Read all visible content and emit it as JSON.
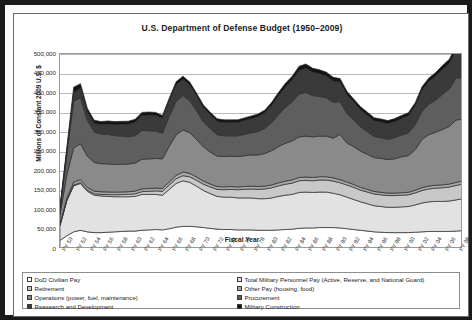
{
  "chart_data": {
    "type": "area",
    "title": "U.S. Department of Defense Budget (1950–2009)",
    "xlabel": "Fiscal Year",
    "ylabel": "Millions of Constant 2009 U.S. $",
    "ylim": [
      0,
      500000
    ],
    "ytick_step": 50000,
    "ytick_labels": [
      "500,000",
      "450,000",
      "400,000",
      "350,000",
      "300,000",
      "250,000",
      "200,000",
      "150,000",
      "100,000",
      "50,000",
      "0"
    ],
    "grid": true,
    "legend_position": "bottom",
    "stacked": true,
    "x": [
      1950,
      1951,
      1952,
      1953,
      1954,
      1955,
      1956,
      1957,
      1958,
      1959,
      1960,
      1961,
      1962,
      1963,
      1964,
      1965,
      1966,
      1967,
      1968,
      1969,
      1970,
      1971,
      1972,
      1973,
      1974,
      1975,
      1976,
      1977,
      1978,
      1979,
      1980,
      1981,
      1982,
      1983,
      1984,
      1985,
      1986,
      1987,
      1988,
      1989,
      1990,
      1991,
      1992,
      1993,
      1994,
      1995,
      1996,
      1997,
      1998,
      1999,
      2000,
      2001,
      2002,
      2003,
      2004,
      2005,
      2006,
      2007,
      2008,
      2009
    ],
    "xtick_labels": [
      "FY 50",
      "FY 52",
      "FY 54",
      "FY 56",
      "FY 58",
      "FY 60",
      "FY 62",
      "FY 64",
      "FY 66",
      "FY 68",
      "FY 70",
      "FY 72",
      "FY 74",
      "FY 76",
      "FY 78",
      "FY 80",
      "FY 82",
      "FY 84",
      "FY 86",
      "FY 88",
      "FY 90",
      "FY 92",
      "FY 94",
      "FY 96",
      "FY 98",
      "FY 00",
      "FY 02",
      "FY 04",
      "FY 06",
      "FY 08"
    ],
    "series": [
      {
        "name": "DoD Civilian Pay",
        "color": "#ffffff",
        "values": [
          22000,
          34000,
          44000,
          48000,
          44000,
          42000,
          42000,
          43000,
          44000,
          45000,
          46000,
          46000,
          48000,
          49000,
          50000,
          49000,
          52000,
          56000,
          58000,
          58000,
          57000,
          55000,
          53000,
          51000,
          50000,
          50000,
          49000,
          49000,
          49000,
          48000,
          48000,
          48000,
          49000,
          50000,
          51000,
          53000,
          54000,
          54000,
          55000,
          55000,
          55000,
          54000,
          52000,
          50000,
          48000,
          46000,
          44000,
          43000,
          42000,
          42000,
          42000,
          42000,
          43000,
          44000,
          45000,
          45000,
          45000,
          45000,
          46000,
          47000
        ]
      },
      {
        "name": "Total Military Personnel Pay (Active, Reserve, and National Guard)",
        "color": "#e2e2e2",
        "values": [
          38000,
          90000,
          118000,
          120000,
          104000,
          96000,
          94000,
          92000,
          90000,
          89000,
          88000,
          89000,
          92000,
          91000,
          90000,
          89000,
          101000,
          112000,
          117000,
          113000,
          104000,
          95000,
          89000,
          84000,
          83000,
          83000,
          82000,
          82000,
          82000,
          81000,
          81000,
          83000,
          86000,
          88000,
          89000,
          92000,
          92000,
          91000,
          91000,
          91000,
          88000,
          85000,
          81000,
          77000,
          73000,
          70000,
          67000,
          66000,
          65000,
          65000,
          66000,
          67000,
          70000,
          74000,
          76000,
          77000,
          77000,
          78000,
          80000,
          82000
        ]
      },
      {
        "name": "Retirement",
        "color": "#c8c8c8",
        "values": [
          1000,
          1500,
          2000,
          2500,
          3000,
          3500,
          4000,
          4500,
          5000,
          5500,
          6000,
          6500,
          7000,
          8000,
          9000,
          10000,
          11000,
          12000,
          13000,
          14000,
          15000,
          16000,
          17000,
          18000,
          19000,
          20000,
          21000,
          22000,
          23000,
          24000,
          25000,
          26000,
          27000,
          28000,
          29000,
          30000,
          30000,
          30000,
          31000,
          31000,
          31000,
          31000,
          31000,
          31000,
          30000,
          30000,
          30000,
          30000,
          30000,
          30000,
          30000,
          30000,
          31000,
          32000,
          33000,
          34000,
          35000,
          36000,
          37000,
          38000
        ]
      },
      {
        "name": "Other Pay (housing, food)",
        "color": "#a8a8a8",
        "values": [
          3000,
          5000,
          7000,
          7500,
          7000,
          6800,
          6800,
          6800,
          6800,
          6800,
          6800,
          7000,
          7200,
          7200,
          7200,
          7200,
          8000,
          8800,
          9200,
          9000,
          8500,
          8000,
          7600,
          7200,
          7200,
          7200,
          7200,
          7200,
          7200,
          7200,
          7200,
          7400,
          7700,
          8000,
          8200,
          8500,
          8500,
          8400,
          8400,
          8400,
          8200,
          8000,
          7700,
          7400,
          7000,
          6800,
          6500,
          6400,
          6300,
          6300,
          6400,
          6500,
          6800,
          7200,
          7400,
          7500,
          7500,
          7600,
          7800,
          8000
        ]
      },
      {
        "name": "Operations (power, fuel, maintenance)",
        "color": "#8a8a8a",
        "values": [
          24000,
          60000,
          88000,
          92000,
          80000,
          74000,
          72000,
          72000,
          71000,
          71000,
          71000,
          72000,
          76000,
          76000,
          76000,
          76000,
          92000,
          104000,
          108000,
          104000,
          96000,
          88000,
          82000,
          78000,
          78000,
          78000,
          78000,
          79000,
          80000,
          81000,
          84000,
          88000,
          93000,
          97000,
          100000,
          104000,
          105000,
          104000,
          104000,
          104000,
          102000,
          116000,
          100000,
          97000,
          93000,
          90000,
          87000,
          87000,
          86000,
          88000,
          92000,
          94000,
          104000,
          124000,
          132000,
          136000,
          142000,
          148000,
          160000,
          158000
        ]
      },
      {
        "name": "Procurement",
        "color": "#5e5e5e",
        "values": [
          14000,
          52000,
          120000,
          118000,
          92000,
          78000,
          76000,
          76000,
          74000,
          72000,
          70000,
          70000,
          74000,
          72000,
          70000,
          66000,
          76000,
          86000,
          88000,
          82000,
          74000,
          64000,
          60000,
          55000,
          53000,
          52000,
          53000,
          55000,
          57000,
          60000,
          64000,
          72000,
          82000,
          92000,
          100000,
          110000,
          112000,
          106000,
          102000,
          98000,
          92000,
          84000,
          76000,
          68000,
          62000,
          58000,
          54000,
          53000,
          52000,
          54000,
          56000,
          58000,
          64000,
          72000,
          78000,
          82000,
          90000,
          96000,
          108000,
          106000
        ]
      },
      {
        "name": "Reasearch and Development",
        "color": "#3a3a3a",
        "values": [
          4000,
          10000,
          22000,
          24000,
          22000,
          22000,
          24000,
          26000,
          28000,
          30000,
          32000,
          34000,
          38000,
          40000,
          40000,
          38000,
          40000,
          42000,
          42000,
          40000,
          38000,
          36000,
          35000,
          34000,
          34000,
          34000,
          34000,
          35000,
          36000,
          38000,
          40000,
          44000,
          48000,
          52000,
          56000,
          60000,
          62000,
          60000,
          58000,
          56000,
          54000,
          50000,
          48000,
          46000,
          44000,
          42000,
          40000,
          40000,
          40000,
          41000,
          42000,
          44000,
          48000,
          54000,
          58000,
          62000,
          64000,
          66000,
          72000,
          74000
        ]
      },
      {
        "name": "Military Construction",
        "color": "#141414",
        "values": [
          2000,
          8000,
          14000,
          12000,
          9000,
          8000,
          8000,
          8000,
          8000,
          8000,
          8000,
          8000,
          8000,
          8000,
          8000,
          7000,
          7000,
          8000,
          8000,
          8000,
          7000,
          7000,
          7000,
          7000,
          7000,
          7000,
          7000,
          7000,
          7000,
          7000,
          7000,
          8000,
          9000,
          10000,
          10000,
          11000,
          11000,
          10000,
          10000,
          10000,
          10000,
          9000,
          9000,
          8000,
          8000,
          8000,
          8000,
          8000,
          8000,
          8000,
          8000,
          8000,
          8000,
          9000,
          9000,
          9000,
          10000,
          10000,
          11000,
          11000
        ]
      }
    ]
  },
  "legend": {
    "column1": [
      {
        "label": "DoD Civilian Pay",
        "color": "#ffffff"
      },
      {
        "label": "Retirement",
        "color": "#c8c8c8"
      },
      {
        "label": "Operations (power, fuel, maintenance)",
        "color": "#8a8a8a"
      },
      {
        "label": "Reasearch and Development",
        "color": "#3a3a3a"
      }
    ],
    "column2": [
      {
        "label": "Total Military Personnel Pay (Active, Reserve, and National Guard)",
        "color": "#e2e2e2"
      },
      {
        "label": "Other Pay (housing, food)",
        "color": "#a8a8a8"
      },
      {
        "label": "Procurement",
        "color": "#5e5e5e"
      },
      {
        "label": "Military Construction",
        "color": "#141414"
      }
    ]
  }
}
